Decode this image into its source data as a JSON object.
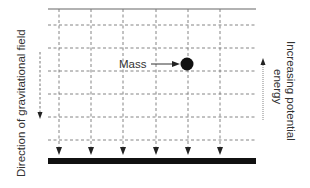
{
  "diagram": {
    "labels": {
      "mass": "Mass",
      "field_direction": "Direction of gravitational field",
      "potential_line1": "Increasing potential",
      "potential_line2": "energy"
    },
    "grid": {
      "columns": 6,
      "horizontal_lines": 6
    },
    "colors": {
      "line": "#555555",
      "grid": "#777777",
      "mass": "#111111",
      "ground": "#111111",
      "text": "#333333"
    }
  }
}
